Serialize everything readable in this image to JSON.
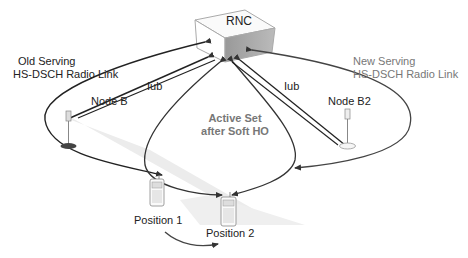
{
  "diagram": {
    "rnc": {
      "label": "RNC"
    },
    "old_link": {
      "line1": "Old Serving",
      "line2": "HS-DSCH Radio Link"
    },
    "new_link": {
      "line1": "New Serving",
      "line2": "HS-DSCH Radio Link"
    },
    "node_b": {
      "label": "Node B"
    },
    "node_b2": {
      "label": "Node B2"
    },
    "iub_left": {
      "label": "Iub"
    },
    "iub_right": {
      "label": "Iub"
    },
    "active_set": {
      "line1": "Active Set",
      "line2": "after Soft HO"
    },
    "position1": {
      "label": "Position 1"
    },
    "position2": {
      "label": "Position 2"
    },
    "colors": {
      "line": "#333333",
      "grey_text": "#777777",
      "beam": "#e6e6e6"
    }
  }
}
